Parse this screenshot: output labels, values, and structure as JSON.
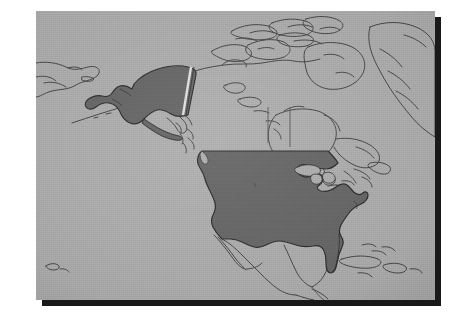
{
  "image": {
    "kind": "reference-map",
    "subject": "North America",
    "caption_visible": false,
    "width_px": 466,
    "height_px": 321
  },
  "plate": {
    "left_px": 36,
    "top_px": 11,
    "width_px": 399,
    "height_px": 289,
    "background_color": "#b4b4b4",
    "shadow_color": "#191919",
    "shadow_offset_px": 6,
    "page_background": "#ffffff"
  },
  "map": {
    "projection_hint": "conic",
    "style": "grayscale halftone scan",
    "land_color": "#b4b4b4",
    "ocean_color": "#b4b4b4",
    "coastline_color": "#4a4a4a",
    "border_color": "#5a5a5a",
    "highlight_fill": "#6a6a6a",
    "highlight_outline": "#2e2e2e",
    "alaska_border_gap_color": "#e8e8e8"
  },
  "highlighted_regions": [
    {
      "name": "United States (contiguous)",
      "fill": "#6a6a6a",
      "highlighted": true
    },
    {
      "name": "Alaska",
      "fill": "#6a6a6a",
      "highlighted": true
    }
  ],
  "unhighlighted_regions": [
    {
      "name": "Canada",
      "highlighted": false
    },
    {
      "name": "Greenland",
      "highlighted": false
    },
    {
      "name": "Mexico",
      "highlighted": false
    },
    {
      "name": "Cuba",
      "highlighted": false
    },
    {
      "name": "Bahamas",
      "highlighted": false
    },
    {
      "name": "Hispaniola",
      "highlighted": false
    },
    {
      "name": "Central America",
      "highlighted": false
    },
    {
      "name": "Russia (Chukotka)",
      "highlighted": false
    },
    {
      "name": "Aleutian Islands",
      "highlighted": false
    },
    {
      "name": "Baffin Island",
      "highlighted": false
    },
    {
      "name": "Victoria Island",
      "highlighted": false
    },
    {
      "name": "Newfoundland",
      "highlighted": false
    }
  ],
  "water_features": [
    {
      "name": "Great Lakes"
    },
    {
      "name": "Hudson Bay"
    },
    {
      "name": "Gulf of Mexico"
    },
    {
      "name": "Pacific Ocean"
    },
    {
      "name": "Atlantic Ocean"
    },
    {
      "name": "Bering Sea"
    },
    {
      "name": "Baffin Bay"
    }
  ],
  "labels": [],
  "legend": {
    "present": false,
    "entries": []
  },
  "scale_bar": {
    "present": false
  },
  "compass": {
    "present": false
  }
}
